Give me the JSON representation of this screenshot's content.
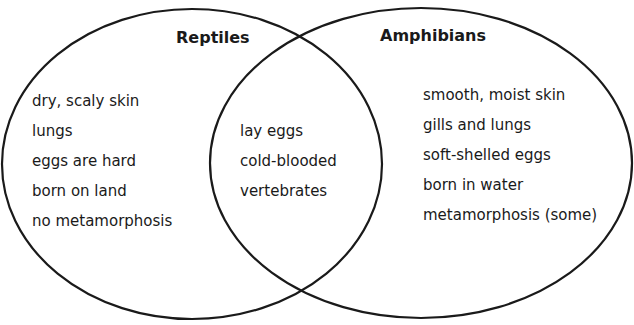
{
  "diagram": {
    "type": "venn",
    "stroke_color": "#1a1a1a",
    "sets": [
      {
        "title": "Reptiles",
        "items": [
          "dry, scaly skin",
          "lungs",
          "eggs are hard",
          "born on land",
          "no metamorphosis"
        ]
      },
      {
        "title": "Amphibians",
        "items": [
          "smooth, moist skin",
          "gills and lungs",
          "soft-shelled eggs",
          "born in water",
          "metamorphosis (some)"
        ]
      }
    ],
    "intersection": {
      "items": [
        "lay eggs",
        "cold-blooded",
        "vertebrates"
      ]
    }
  }
}
